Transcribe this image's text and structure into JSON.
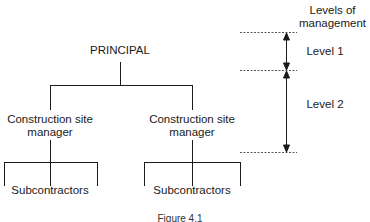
{
  "diagram": {
    "type": "org-chart",
    "root": {
      "label": "PRINCIPAL"
    },
    "managers": [
      {
        "label_line1": "Construction site",
        "label_line2": "manager",
        "children_label": "Subcontractors"
      },
      {
        "label_line1": "Construction site",
        "label_line2": "manager",
        "children_label": "Subcontractors"
      }
    ],
    "levels_header": {
      "line1": "Levels of",
      "line2": "management"
    },
    "levels": [
      {
        "label": "Level 1"
      },
      {
        "label": "Level 2"
      }
    ],
    "caption": "Figure 4.1"
  },
  "colors": {
    "line": "#1a1a1a",
    "dashed": "#555555",
    "background": "#ffffff"
  }
}
